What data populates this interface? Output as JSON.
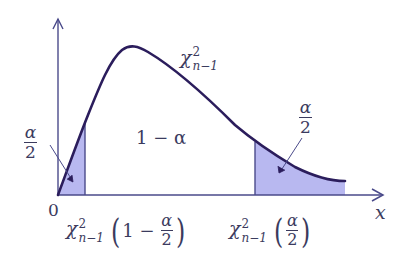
{
  "figure": {
    "colors": {
      "curve": "#2b1d5c",
      "axis": "#4a4a8a",
      "shade": "#b8b8f0",
      "text": "#3b3b5e"
    },
    "axes": {
      "x_label": "x",
      "origin_label": "0"
    },
    "curve_label": {
      "symbol": "χ",
      "sup": "2",
      "sub": "n−1"
    },
    "center_region_label": "1 − α",
    "left_tail": {
      "area_num": "α",
      "area_den": "2",
      "quantile": {
        "symbol": "χ",
        "sup": "2",
        "sub": "n−1",
        "lparen": "(",
        "arg_prefix": "1 −",
        "arg_num": "α",
        "arg_den": "2",
        "rparen": ")"
      }
    },
    "right_tail": {
      "area_num": "α",
      "area_den": "2",
      "quantile": {
        "symbol": "χ",
        "sup": "2",
        "sub": "n−1",
        "lparen": "(",
        "arg_num": "α",
        "arg_den": "2",
        "rparen": ")"
      }
    }
  }
}
